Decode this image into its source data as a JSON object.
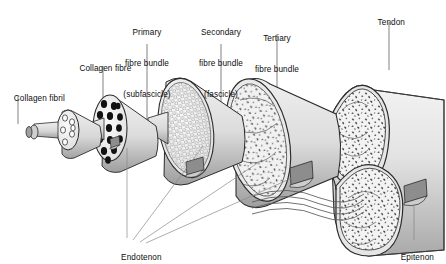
{
  "figure": {
    "background_color": "#ffffff",
    "line_color": "#2b2b2b",
    "label_color": "#0d0d0d",
    "fill_light": "#ededed",
    "fill_mid": "#c9c9c9",
    "fill_dark": "#9a9a9a",
    "flap_color": "#8d8d8d"
  },
  "labels": {
    "collagen_fibril": "Collagen fibril",
    "collagen_fibre": "Collagen fibre",
    "primary_bundle_l1": "Primary",
    "primary_bundle_l2": "fibre bundle",
    "primary_bundle_l3": "(subfascicle)",
    "secondary_bundle_l1": "Secondary",
    "secondary_bundle_l2": "fibre bundle",
    "secondary_bundle_l3": "(fascicle)",
    "tertiary_bundle_l1": "Tertiary",
    "tertiary_bundle_l2": "fibre bundle",
    "tendon": "Tendon",
    "endotenon": "Endotenon",
    "epitenon": "Epitenon"
  },
  "structures": [
    {
      "name": "collagen-fibril",
      "level": 1,
      "face": "plain-cylinder",
      "label": "Collagen fibril"
    },
    {
      "name": "collagen-fibre",
      "level": 2,
      "face": "few-round-holes",
      "holes": 6,
      "label": "Collagen fibre"
    },
    {
      "name": "primary-fibre-bundle",
      "level": 3,
      "face": "black-dots",
      "dots": 15,
      "label": "Primary fibre bundle (subfascicle)"
    },
    {
      "name": "secondary-fibre-bundle",
      "level": 4,
      "face": "honeycomb-circles",
      "label": "Secondary fibre bundle (fascicle)"
    },
    {
      "name": "tertiary-fibre-bundle",
      "level": 5,
      "face": "speckled-lobes",
      "label": "Tertiary fibre bundle"
    },
    {
      "name": "tendon",
      "level": 6,
      "face": "speckled-two-lobes",
      "label": "Tendon"
    }
  ],
  "sheaths": [
    {
      "name": "endotenon",
      "label": "Endotenon",
      "leader_count": 3
    },
    {
      "name": "epitenon",
      "label": "Epitenon",
      "leader_count": 1
    }
  ]
}
